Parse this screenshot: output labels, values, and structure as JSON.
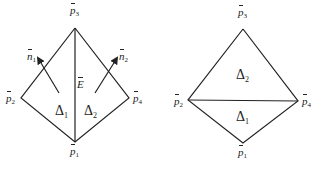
{
  "left_diagram": {
    "vertices": {
      "p1": {
        "label": "p",
        "sub": "1",
        "x": 75,
        "y": 142
      },
      "p2": {
        "label": "p",
        "sub": "2",
        "x": 21,
        "y": 98
      },
      "p3": {
        "label": "p",
        "sub": "3",
        "x": 75,
        "y": 28
      },
      "p4": {
        "label": "p",
        "sub": "4",
        "x": 129,
        "y": 98
      }
    },
    "edge_label": {
      "label": "E"
    },
    "normals": [
      {
        "label": "n",
        "sub": "1"
      },
      {
        "label": "n",
        "sub": "2"
      }
    ],
    "triangles": [
      {
        "label": "Δ",
        "sub": "1"
      },
      {
        "label": "Δ",
        "sub": "2"
      }
    ]
  },
  "right_diagram": {
    "vertices": {
      "p1": {
        "label": "p",
        "sub": "1",
        "x": 243,
        "y": 143
      },
      "p2": {
        "label": "p",
        "sub": "2",
        "x": 188,
        "y": 100
      },
      "p3": {
        "label": "p",
        "sub": "3",
        "x": 243,
        "y": 29
      },
      "p4": {
        "label": "p",
        "sub": "4",
        "x": 298,
        "y": 101
      }
    },
    "triangles": [
      {
        "label": "Δ",
        "sub": "2"
      },
      {
        "label": "Δ",
        "sub": "1"
      }
    ]
  },
  "colors": {
    "stroke": "#222222",
    "background": "#ffffff"
  }
}
